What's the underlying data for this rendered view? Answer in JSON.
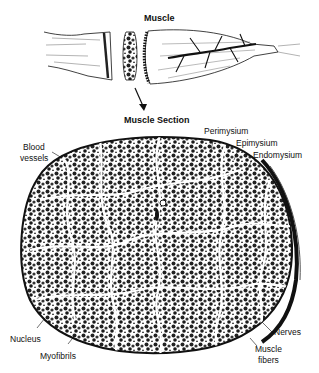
{
  "diagram": {
    "title_top": "Muscle",
    "title_section": "Muscle Section",
    "labels": {
      "perimysium": "Perimysium",
      "epimysium": "Epimysium",
      "endomysium": "Endomysium",
      "blood_vessels_line1": "Blood",
      "blood_vessels_line2": "vessels",
      "nucleus": "Nucleus",
      "myofibrils": "Myofibrils",
      "nerves": "Nerves",
      "muscle_fibers_line1": "Muscle",
      "muscle_fibers_line2": "fibers"
    },
    "colors": {
      "ink": "#111111",
      "paper": "#ffffff",
      "fill_dark": "#2a2a2a",
      "fill_mid": "#6a6a6a"
    }
  }
}
